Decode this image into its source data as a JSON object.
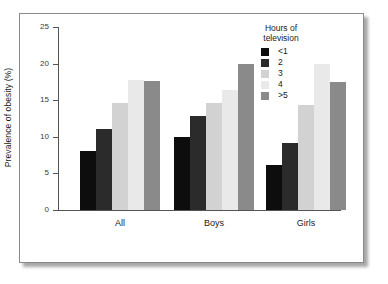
{
  "chart_data": {
    "type": "bar",
    "title": "",
    "subtitle": "",
    "xlabel": "",
    "ylabel": "Prevalence of obesity (%)",
    "categories": [
      "All",
      "Boys",
      "Girls"
    ],
    "ylim": [
      0,
      25
    ],
    "yticks": [
      0,
      5,
      10,
      15,
      20,
      25
    ],
    "ytick_labels": [
      "0",
      "5",
      "10",
      "15",
      "20",
      "25"
    ],
    "grid": false,
    "legend_position": "top-right",
    "legend_title": "Hours of\ntelevision",
    "series": [
      {
        "name": "<1",
        "color": "#0d0d0d",
        "values": [
          8.0,
          10.0,
          6.1
        ]
      },
      {
        "name": "2",
        "color": "#2b2b2b",
        "values": [
          11.1,
          12.9,
          9.1
        ]
      },
      {
        "name": "3",
        "color": "#d2d2d2",
        "values": [
          14.6,
          14.6,
          14.4
        ]
      },
      {
        "name": "4",
        "color": "#e9e9e9",
        "values": [
          17.7,
          16.4,
          20.0
        ]
      },
      {
        "name": ">5",
        "color": "#8a8a8a",
        "values": [
          17.6,
          19.9,
          17.5
        ]
      }
    ]
  },
  "legend": {
    "title_line1": "Hours of",
    "title_line2": "television",
    "items": [
      {
        "label": "<1"
      },
      {
        "label": "2"
      },
      {
        "label": "3"
      },
      {
        "label": "4"
      },
      {
        "label": ">5"
      }
    ]
  },
  "axes": {
    "y_title": "Prevalence of obesity (%)",
    "y_labels": [
      "25",
      "20",
      "15",
      "10",
      "5",
      "0"
    ],
    "x_labels": [
      "All",
      "Boys",
      "Girls"
    ]
  }
}
